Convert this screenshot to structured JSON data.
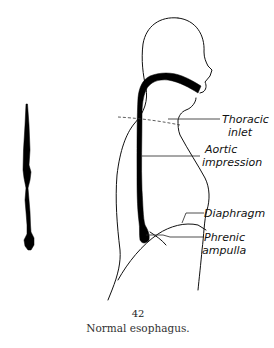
{
  "figure": {
    "number": "42",
    "caption": "Normal esophagus."
  },
  "labels": {
    "thoracic_inlet": [
      "Thoracic",
      "inlet"
    ],
    "aortic_impression": [
      "Aortic",
      "impression"
    ],
    "diaphragm": [
      "Diaphragm"
    ],
    "phrenic_ampulla": [
      "Phrenic",
      "ampulla"
    ]
  },
  "colors": {
    "ink": "#000000",
    "background": "#ffffff"
  }
}
